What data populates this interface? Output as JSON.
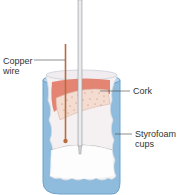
{
  "diagram": {
    "type": "calorimeter",
    "labels": {
      "copper_wire_line1": "Copper",
      "copper_wire_line2": "wire",
      "cork": "Cork",
      "styrofoam_line1": "Styrofoam",
      "styrofoam_line2": "cups"
    },
    "colors": {
      "outer_cup": "#8fbcdc",
      "outer_cup_edge": "#6fa3cb",
      "inner_cup": "#f3eef0",
      "cork_top": "#e48574",
      "cork_body": "#f4dcd0",
      "cork_speckle": "#b0705a",
      "copper_wire": "#b86b3c",
      "thermometer": "#d9dadd",
      "thermometer_edge": "#9a9ca0",
      "leader_line": "#444444"
    }
  }
}
